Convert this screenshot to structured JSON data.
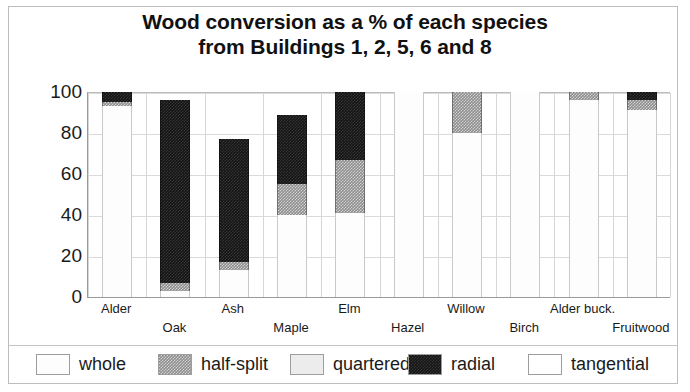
{
  "chart_data": {
    "type": "bar",
    "subtype": "stacked-bar",
    "title": "Wood conversion as a % of each species from Buildings 1, 2, 5, 6 and 8",
    "title_lines": [
      "Wood conversion as a % of each species",
      "from Buildings 1, 2, 5, 6 and 8"
    ],
    "xlabel": "",
    "ylabel": "",
    "ylim": [
      0,
      100
    ],
    "yticks": [
      0,
      20,
      40,
      60,
      80,
      100
    ],
    "ytick_labels": [
      "0",
      "20",
      "40",
      "60",
      "80",
      "100"
    ],
    "grid": true,
    "legend_position": "bottom",
    "categories": [
      "Alder",
      "Oak",
      "Ash",
      "Maple",
      "Elm",
      "Hazel",
      "Willow",
      "Birch",
      "Alder buck.",
      "Fruitwood"
    ],
    "series": [
      {
        "name": "whole",
        "color": "#fdfdfd",
        "values": [
          93,
          3,
          13,
          40,
          41,
          100,
          80,
          100,
          96,
          91
        ]
      },
      {
        "name": "half-split",
        "color": "#8d8d8d",
        "values": [
          2,
          4,
          4,
          15,
          26,
          0,
          20,
          0,
          4,
          5
        ]
      },
      {
        "name": "quartered",
        "color": "#ececec",
        "values": [
          0,
          0,
          0,
          0,
          0,
          0,
          0,
          0,
          0,
          0
        ]
      },
      {
        "name": "radial",
        "color": "#141414",
        "values": [
          5,
          89,
          60,
          34,
          33,
          0,
          0,
          0,
          0,
          4
        ]
      },
      {
        "name": "tangential",
        "color": "#ffffff",
        "values": [
          0,
          0,
          0,
          0,
          0,
          0,
          0,
          0,
          0,
          0
        ]
      }
    ],
    "totals": [
      100,
      96,
      77,
      89,
      100,
      100,
      100,
      100,
      100,
      100
    ]
  },
  "legend": {
    "items": [
      {
        "label": "whole",
        "swatch": "swatch-whole"
      },
      {
        "label": "half-split",
        "swatch": "swatch-half-split"
      },
      {
        "label": "quartered",
        "swatch": "swatch-quartered"
      },
      {
        "label": "radial",
        "swatch": "swatch-radial"
      },
      {
        "label": "tangential",
        "swatch": "swatch-tangential"
      }
    ]
  }
}
